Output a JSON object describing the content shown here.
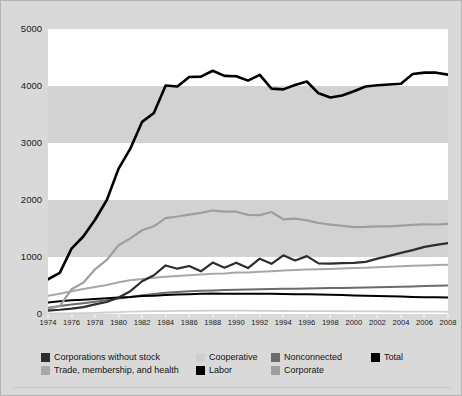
{
  "chart_data": {
    "type": "line",
    "title": "",
    "xlabel": "",
    "ylabel": "",
    "xlim": [
      1974,
      2008
    ],
    "ylim": [
      0,
      5000
    ],
    "grid": "horizontal-bands",
    "legend_position": "bottom",
    "ytick_labels": [
      "5000",
      "4000",
      "3000",
      "2000",
      "1000",
      "0"
    ],
    "ytick_values": [
      5000,
      4000,
      3000,
      2000,
      1000,
      0
    ],
    "xtick_labels": [
      "1974",
      "1976",
      "1978",
      "1980",
      "1982",
      "1984",
      "1986",
      "1988",
      "1990",
      "1992",
      "1994",
      "1996",
      "1998",
      "2000",
      "2002",
      "2004",
      "2006",
      "2008"
    ],
    "x": [
      1974,
      1975,
      1976,
      1977,
      1978,
      1979,
      1980,
      1981,
      1982,
      1983,
      1984,
      1985,
      1986,
      1987,
      1988,
      1989,
      1990,
      1991,
      1992,
      1993,
      1994,
      1995,
      1996,
      1997,
      1998,
      1999,
      2000,
      2001,
      2002,
      2003,
      2004,
      2005,
      2006,
      2007,
      2008
    ],
    "series": [
      {
        "name": "Total",
        "color": "#000000",
        "width": 2.6,
        "values": [
          608,
          722,
          1146,
          1360,
          1653,
          2000,
          2551,
          2901,
          3371,
          3525,
          4009,
          3992,
          4157,
          4165,
          4268,
          4178,
          4172,
          4094,
          4195,
          3954,
          3941,
          4016,
          4079,
          3871,
          3798,
          3835,
          3907,
          3992,
          4012,
          4027,
          4040,
          4210,
          4234,
          4234,
          4199
        ]
      },
      {
        "name": "Corporate",
        "color": "#9e9e9e",
        "width": 2.2,
        "values": [
          89,
          139,
          433,
          550,
          785,
          950,
          1206,
          1327,
          1469,
          1538,
          1682,
          1710,
          1744,
          1775,
          1816,
          1796,
          1795,
          1738,
          1735,
          1789,
          1660,
          1674,
          1642,
          1597,
          1567,
          1548,
          1523,
          1527,
          1538,
          1538,
          1550,
          1562,
          1571,
          1570,
          1580
        ]
      },
      {
        "name": "Corporations without stock",
        "color": "#2d2d2d",
        "width": 2.2,
        "values": [
          60,
          75,
          95,
          120,
          170,
          210,
          290,
          400,
          575,
          680,
          852,
          795,
          842,
          748,
          902,
          812,
          901,
          806,
          971,
          880,
          1029,
          939,
          1015,
          889,
          884,
          893,
          896,
          915,
          972,
          1020,
          1072,
          1120,
          1178,
          1212,
          1245
        ]
      },
      {
        "name": "Trade, membership, and health",
        "color": "#a8a8a8",
        "width": 2.0,
        "values": [
          318,
          357,
          400,
          438,
          475,
          510,
          558,
          592,
          613,
          637,
          655,
          668,
          680,
          692,
          705,
          712,
          726,
          730,
          742,
          752,
          762,
          770,
          779,
          785,
          791,
          797,
          806,
          812,
          820,
          828,
          838,
          845,
          852,
          858,
          862
        ]
      },
      {
        "name": "Nonconnected",
        "color": "#6b6b6b",
        "width": 2.0,
        "values": [
          110,
          140,
          165,
          190,
          215,
          240,
          272,
          300,
          331,
          351,
          371,
          386,
          397,
          406,
          413,
          420,
          424,
          429,
          433,
          438,
          442,
          445,
          449,
          452,
          455,
          458,
          462,
          466,
          470,
          474,
          479,
          484,
          490,
          495,
          500
        ]
      },
      {
        "name": "Labor",
        "color": "#000000",
        "width": 2.0,
        "values": [
          201,
          224,
          240,
          252,
          263,
          275,
          290,
          300,
          316,
          322,
          333,
          341,
          347,
          354,
          360,
          355,
          357,
          354,
          356,
          354,
          350,
          348,
          345,
          340,
          337,
          332,
          326,
          319,
          314,
          310,
          305,
          300,
          296,
          292,
          288
        ]
      },
      {
        "name": "Cooperative",
        "color": "#cfcfcf",
        "width": 1.8,
        "values": [
          6,
          9,
          12,
          16,
          20,
          26,
          34,
          41,
          47,
          51,
          52,
          54,
          56,
          57,
          59,
          59,
          59,
          58,
          56,
          54,
          53,
          52,
          51,
          50,
          49,
          48,
          47,
          46,
          45,
          44,
          43,
          42,
          41,
          40,
          39
        ]
      }
    ]
  },
  "legend": {
    "row1": [
      {
        "label": "Corporations without stock",
        "color": "#2d2d2d"
      },
      {
        "label": "Cooperative",
        "color": "#cfcfcf"
      },
      {
        "label": "Nonconnected",
        "color": "#6b6b6b"
      },
      {
        "label": "Total",
        "color": "#000000"
      }
    ],
    "row2": [
      {
        "label": "Trade, membership, and health",
        "color": "#a8a8a8"
      },
      {
        "label": "Labor",
        "color": "#000000"
      },
      {
        "label": "Corporate",
        "color": "#9e9e9e"
      }
    ]
  },
  "style": {
    "figure_background": "#d9d9d9",
    "band_light": "#ffffff",
    "band_dark": "#d2d2d2",
    "border": "#b4b4b4"
  }
}
